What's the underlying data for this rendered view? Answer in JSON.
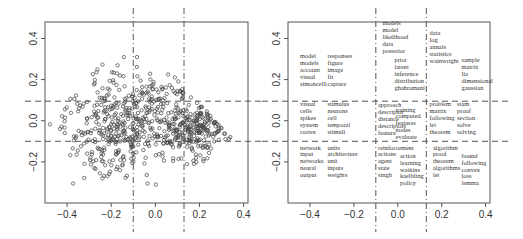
{
  "chart_data": [
    {
      "type": "scatter",
      "title": "",
      "xlabel": "",
      "ylabel": "",
      "xlim": [
        -0.5,
        0.42
      ],
      "ylim": [
        -0.4,
        0.48
      ],
      "xticks": [
        -0.4,
        -0.2,
        0.0,
        0.2,
        0.4
      ],
      "xtick_labels": [
        "−0.4",
        "−0.2",
        "0.0",
        "0.2",
        "0.4"
      ],
      "yticks": [
        -0.2,
        0.0,
        0.2,
        0.4
      ],
      "ytick_labels": [
        "−0.2",
        "0.0",
        "0.2",
        "0.4"
      ],
      "grid": false,
      "legend": null,
      "vertical_dashed_lines_x": [
        -0.1,
        0.13
      ],
      "horizontal_dashed_lines_y": [
        0.095,
        -0.1
      ],
      "n_points_approx": 700,
      "point_marker": "open circle",
      "description": "Cloud of ~700 points, densest near (0.2,-0.05), triangular spread with peak near y=0.45 at x=-0.2"
    },
    {
      "type": "table",
      "title": "",
      "description": "Word clusters positioned in a 3x3 grid partitioned by dashed lines",
      "xlim": [
        -0.5,
        0.42
      ],
      "ylim": [
        -0.4,
        0.48
      ],
      "xticks": [
        -0.4,
        -0.2,
        0.0,
        0.2,
        0.4
      ],
      "xtick_labels": [
        "−0.4",
        "−0.2",
        "0.0",
        "0.2",
        "0.4"
      ],
      "yticks": [
        -0.2,
        0.0,
        0.2,
        0.4
      ],
      "ytick_labels": [
        "−0.2",
        "0.0",
        "0.2",
        "0.4"
      ],
      "vertical_dashed_lines_x": [
        -0.1,
        0.13
      ],
      "horizontal_dashed_lines_y": [
        0.095,
        -0.1
      ],
      "word_groups": [
        {
          "cell": "top-left-a",
          "x": -0.445,
          "y": 0.305,
          "words": [
            "model",
            "models",
            "account",
            "visual",
            "simoncelli"
          ]
        },
        {
          "cell": "top-left-b",
          "x": -0.32,
          "y": 0.305,
          "words": [
            "responses",
            "figure",
            "image",
            "fit",
            "capture"
          ]
        },
        {
          "cell": "top-middle-a",
          "x": -0.07,
          "y": 0.465,
          "words": [
            "models",
            "model",
            "likelihood",
            "data",
            "posterior"
          ]
        },
        {
          "cell": "top-middle-b",
          "x": -0.015,
          "y": 0.285,
          "words": [
            "prior",
            "latent",
            "inference",
            "distribution",
            "ghahramani"
          ]
        },
        {
          "cell": "top-right-a",
          "x": 0.145,
          "y": 0.415,
          "words": [
            "data",
            "log",
            "annals",
            "statistics",
            "wainwright"
          ]
        },
        {
          "cell": "top-right-b",
          "x": 0.29,
          "y": 0.285,
          "words": [
            "sample",
            "matrix",
            "lia",
            "dimensional",
            "gaussian"
          ]
        },
        {
          "cell": "mid-left-a",
          "x": -0.445,
          "y": 0.07,
          "words": [
            "visual",
            "cells",
            "spikes",
            "system",
            "cortex"
          ]
        },
        {
          "cell": "mid-left-b",
          "x": -0.32,
          "y": 0.07,
          "words": [
            "stimulus",
            "neurons",
            "cell",
            "temporal",
            "stimuli"
          ]
        },
        {
          "cell": "mid-middle-a",
          "x": -0.09,
          "y": 0.065,
          "words": [
            "approach",
            "descriptor",
            "distance",
            "descriptors",
            "feature"
          ]
        },
        {
          "cell": "mid-middle-b",
          "x": -0.01,
          "y": 0.045,
          "words": [
            "training",
            "computed",
            "features",
            "nodes",
            "evaluate"
          ]
        },
        {
          "cell": "mid-right-a",
          "x": 0.145,
          "y": 0.07,
          "words": [
            "problem",
            "matrix",
            "following",
            "let",
            "theorem"
          ]
        },
        {
          "cell": "mid-right-b",
          "x": 0.27,
          "y": 0.07,
          "words": [
            "siam",
            "proof",
            "section",
            "solve",
            "solving"
          ]
        },
        {
          "cell": "bot-left-a",
          "x": -0.445,
          "y": -0.14,
          "words": [
            "network",
            "input",
            "networks",
            "neural",
            "output"
          ]
        },
        {
          "cell": "bot-left-b",
          "x": -0.32,
          "y": -0.14,
          "words": [
            "units",
            "architecture",
            "unit",
            "inputs",
            "weights"
          ]
        },
        {
          "cell": "bot-middle-a",
          "x": -0.09,
          "y": -0.14,
          "words": [
            "reinforcement",
            "actions",
            "agent",
            "state",
            "singh"
          ]
        },
        {
          "cell": "bot-middle-b",
          "x": 0.01,
          "y": -0.18,
          "words": [
            "action",
            "learning",
            "watkins",
            "kaelbling",
            "policy"
          ]
        },
        {
          "cell": "bot-right-a",
          "x": 0.16,
          "y": -0.14,
          "words": [
            "algorithm",
            "proof",
            "theorem",
            "algorithms",
            "let"
          ]
        },
        {
          "cell": "bot-right-b",
          "x": 0.29,
          "y": -0.18,
          "words": [
            "bound",
            "following",
            "convex",
            "loss",
            "lemma"
          ]
        }
      ]
    }
  ],
  "panels": {
    "left": {
      "ox": 45,
      "oy": 22,
      "w": 203,
      "h": 181
    },
    "right": {
      "ox": 288,
      "oy": 22,
      "w": 202,
      "h": 181
    }
  },
  "scatter_seed": 12345
}
